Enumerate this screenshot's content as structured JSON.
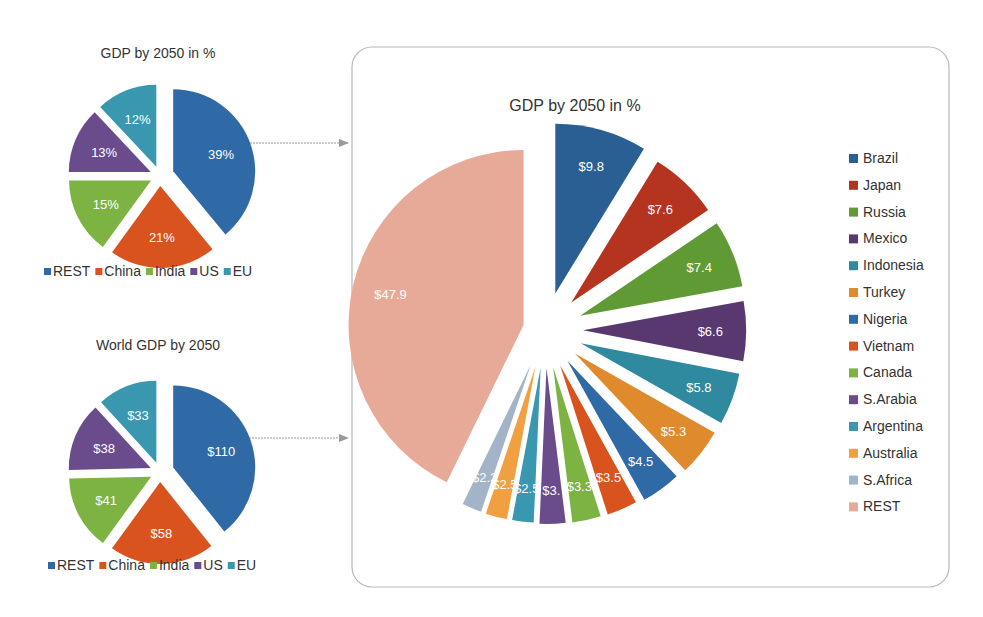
{
  "chart_data": [
    {
      "id": "small-pct",
      "type": "pie",
      "title": "GDP by 2050 in %",
      "categories": [
        "REST",
        "China",
        "India",
        "US",
        "EU"
      ],
      "values": [
        39,
        21,
        15,
        13,
        12
      ],
      "labels": [
        "39%",
        "21%",
        "15%",
        "13%",
        "12%"
      ],
      "colors": [
        "#2f6aa6",
        "#d9531e",
        "#7cb342",
        "#6a4c8c",
        "#3a97b0"
      ],
      "exploded": true,
      "legend": "bottom"
    },
    {
      "id": "small-usd",
      "type": "pie",
      "title": "World GDP by 2050",
      "categories": [
        "REST",
        "China",
        "India",
        "US",
        "EU"
      ],
      "values": [
        110,
        58,
        41,
        38,
        33
      ],
      "labels": [
        "$110",
        "$58",
        "$41",
        "$38",
        "$33"
      ],
      "colors": [
        "#2f6aa6",
        "#d9531e",
        "#7cb342",
        "#6a4c8c",
        "#3a97b0"
      ],
      "exploded": true,
      "legend": "bottom"
    },
    {
      "id": "big",
      "type": "pie",
      "title": "GDP by 2050 in %",
      "categories": [
        "Brazil",
        "Japan",
        "Russia",
        "Mexico",
        "Indonesia",
        "Turkey",
        "Nigeria",
        "Vietnam",
        "Canada",
        "S.Arabia",
        "Argentina",
        "Australia",
        "S.Africa",
        "REST"
      ],
      "values": [
        9.8,
        7.6,
        7.4,
        6.6,
        5.8,
        5.3,
        4.5,
        3.5,
        3.3,
        3.0,
        2.5,
        2.5,
        2.3,
        47.9
      ],
      "labels": [
        "$9.8",
        "$7.6",
        "$7.4",
        "$6.6",
        "$5.8",
        "$5.3",
        "$4.5",
        "$3.5",
        "$3.3",
        "$3.",
        "$2.5",
        "$2.5",
        "$2.3",
        "$47.9"
      ],
      "colors": [
        "#2a5f94",
        "#b5341f",
        "#5f9a34",
        "#59386f",
        "#2f8a9f",
        "#e08a2e",
        "#2f6aa6",
        "#d9531e",
        "#7cb342",
        "#6a4c8c",
        "#3a97b0",
        "#f0a040",
        "#a4b4c8",
        "#e8aa98"
      ],
      "exploded": true,
      "legend": "right"
    }
  ],
  "connectors": [
    "arrow-top",
    "arrow-bottom"
  ]
}
